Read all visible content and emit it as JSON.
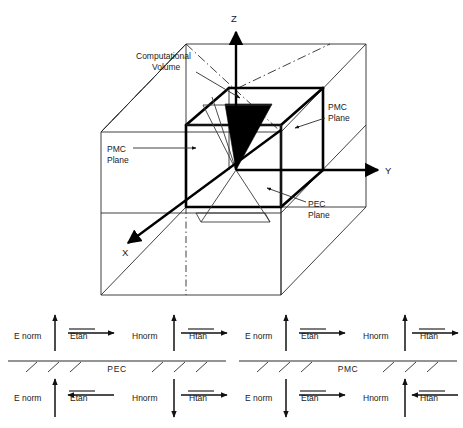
{
  "figure": {
    "axes": {
      "z_label": "Z",
      "y_label": "Y",
      "x_label": "X"
    },
    "annotations": {
      "computational_volume_line1": "Computational",
      "computational_volume_line2": "Volume",
      "pmc_plane_left_line1": "PMC",
      "pmc_plane_left_line2": "Plane",
      "pmc_plane_right_line1": "PMC",
      "pmc_plane_right_line2": "Plane",
      "pec_plane_line1": "PEC",
      "pec_plane_line2": "Plane"
    },
    "colors": {
      "ink": "#000000",
      "thin_ink": "#2b2b2b",
      "paper": "#ffffff",
      "source_fill": "#000000"
    }
  },
  "boundary_panels": [
    {
      "id": "pec-panel",
      "surface_label": "PEC",
      "above": [
        {
          "name": "Enorm",
          "label": "E norm",
          "overbar": false,
          "arrow": "up"
        },
        {
          "name": "Etan",
          "label": "Etan",
          "overbar": true,
          "arrow": "right"
        },
        {
          "name": "Hnorm",
          "label": "Hnorm",
          "overbar": false,
          "arrow": "up"
        },
        {
          "name": "Htan",
          "label": "Htan",
          "overbar": true,
          "arrow": "right"
        }
      ],
      "below": [
        {
          "name": "Enorm",
          "label": "E norm",
          "overbar": false,
          "arrow": "up"
        },
        {
          "name": "Etan",
          "label": "Etan",
          "overbar": true,
          "arrow": "left"
        },
        {
          "name": "Hnorm",
          "label": "Hnorm",
          "overbar": false,
          "arrow": "down"
        },
        {
          "name": "Htan",
          "label": "Htan",
          "overbar": true,
          "arrow": "right"
        }
      ]
    },
    {
      "id": "pmc-panel",
      "surface_label": "PMC",
      "above": [
        {
          "name": "Enorm",
          "label": "E norm",
          "overbar": false,
          "arrow": "up"
        },
        {
          "name": "Etan",
          "label": "Etan",
          "overbar": true,
          "arrow": "right"
        },
        {
          "name": "Hnorm",
          "label": "Hnorm",
          "overbar": false,
          "arrow": "up"
        },
        {
          "name": "Htan",
          "label": "Htan",
          "overbar": true,
          "arrow": "right"
        }
      ],
      "below": [
        {
          "name": "Enorm",
          "label": "E norm",
          "overbar": false,
          "arrow": "down"
        },
        {
          "name": "Etan",
          "label": "Etan",
          "overbar": true,
          "arrow": "right"
        },
        {
          "name": "Hnorm",
          "label": "Hnorm",
          "overbar": false,
          "arrow": "up"
        },
        {
          "name": "Htan",
          "label": "Htan",
          "overbar": true,
          "arrow": "left"
        }
      ]
    }
  ]
}
